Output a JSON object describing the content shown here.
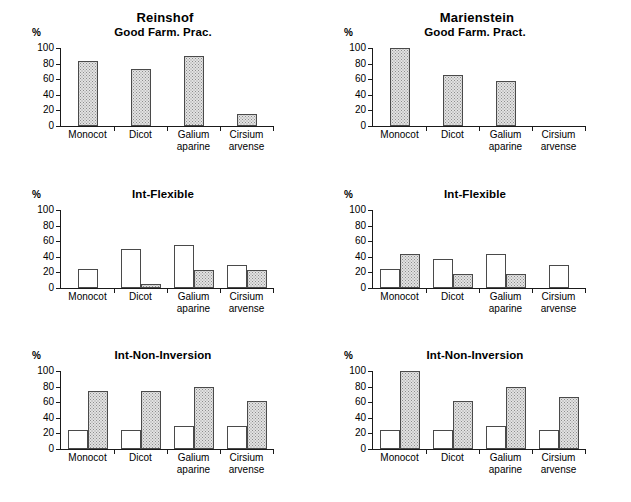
{
  "figure": {
    "sites": [
      {
        "name": "Reinshof"
      },
      {
        "name": "Marienstein"
      }
    ],
    "axis": {
      "unit_label": "%",
      "y_ticks": [
        "0",
        "20",
        "40",
        "60",
        "80",
        "100"
      ],
      "y_min": 0,
      "y_max": 100
    },
    "categories": [
      "Monocot",
      "Dicot",
      "Galium\naparine",
      "Cirsium\narvense"
    ]
  },
  "chart_data": [
    {
      "type": "bar",
      "title": "Good Farm. Prac.",
      "site": "Reinshof",
      "panel_id": "reinshof-good-farm-prac",
      "xlabel": "",
      "ylabel": "%",
      "ylim": [
        0,
        100
      ],
      "yticks": [
        0,
        20,
        40,
        60,
        80,
        100
      ],
      "grid": false,
      "legend": "none",
      "categories": [
        "Monocot",
        "Dicot",
        "Galium aparine",
        "Cirsium arvense"
      ],
      "series": [
        {
          "name": "open",
          "style": "white-outline",
          "values": [
            null,
            null,
            null,
            null
          ]
        },
        {
          "name": "stippled",
          "style": "grey-stipple",
          "values": [
            83,
            73,
            90,
            16
          ]
        }
      ]
    },
    {
      "type": "bar",
      "title": "Good Farm. Pract.",
      "site": "Marienstein",
      "panel_id": "marienstein-good-farm-pract",
      "xlabel": "",
      "ylabel": "%",
      "ylim": [
        0,
        100
      ],
      "yticks": [
        0,
        20,
        40,
        60,
        80,
        100
      ],
      "grid": false,
      "legend": "none",
      "categories": [
        "Monocot",
        "Dicot",
        "Galium aparine",
        "Cirsium arvense"
      ],
      "series": [
        {
          "name": "open",
          "style": "white-outline",
          "values": [
            null,
            null,
            null,
            null
          ]
        },
        {
          "name": "stippled",
          "style": "grey-stipple",
          "values": [
            100,
            66,
            58,
            0
          ]
        }
      ]
    },
    {
      "type": "bar",
      "title": "Int-Flexible",
      "site": "Reinshof",
      "panel_id": "reinshof-int-flexible",
      "xlabel": "",
      "ylabel": "%",
      "ylim": [
        0,
        100
      ],
      "yticks": [
        0,
        20,
        40,
        60,
        80,
        100
      ],
      "grid": false,
      "legend": "none",
      "categories": [
        "Monocot",
        "Dicot",
        "Galium aparine",
        "Cirsium arvense"
      ],
      "series": [
        {
          "name": "open",
          "style": "white-outline",
          "values": [
            25,
            50,
            55,
            30
          ]
        },
        {
          "name": "stippled",
          "style": "grey-stipple",
          "values": [
            0,
            5,
            23,
            23
          ]
        }
      ]
    },
    {
      "type": "bar",
      "title": "Int-Flexible",
      "site": "Marienstein",
      "panel_id": "marienstein-int-flexible",
      "xlabel": "",
      "ylabel": "%",
      "ylim": [
        0,
        100
      ],
      "yticks": [
        0,
        20,
        40,
        60,
        80,
        100
      ],
      "grid": false,
      "legend": "none",
      "categories": [
        "Monocot",
        "Dicot",
        "Galium aparine",
        "Cirsium arvense"
      ],
      "series": [
        {
          "name": "open",
          "style": "white-outline",
          "values": [
            25,
            37,
            43,
            30
          ]
        },
        {
          "name": "stippled",
          "style": "grey-stipple",
          "values": [
            43,
            18,
            18,
            0
          ]
        }
      ]
    },
    {
      "type": "bar",
      "title": "Int-Non-Inversion",
      "site": "Reinshof",
      "panel_id": "reinshof-int-non-inversion",
      "xlabel": "",
      "ylabel": "%",
      "ylim": [
        0,
        100
      ],
      "yticks": [
        0,
        20,
        40,
        60,
        80,
        100
      ],
      "grid": false,
      "legend": "none",
      "categories": [
        "Monocot",
        "Dicot",
        "Galium aparine",
        "Cirsium arvense"
      ],
      "series": [
        {
          "name": "open",
          "style": "white-outline",
          "values": [
            25,
            24,
            29,
            29
          ]
        },
        {
          "name": "stippled",
          "style": "grey-stipple",
          "values": [
            75,
            74,
            80,
            61
          ]
        }
      ]
    },
    {
      "type": "bar",
      "title": "Int-Non-Inversion",
      "site": "Marienstein",
      "panel_id": "marienstein-int-non-inversion",
      "xlabel": "",
      "ylabel": "%",
      "ylim": [
        0,
        100
      ],
      "yticks": [
        0,
        20,
        40,
        60,
        80,
        100
      ],
      "grid": false,
      "legend": "none",
      "categories": [
        "Monocot",
        "Dicot",
        "Galium aparine",
        "Cirsium arvense"
      ],
      "series": [
        {
          "name": "open",
          "style": "white-outline",
          "values": [
            25,
            24,
            30,
            24
          ]
        },
        {
          "name": "stippled",
          "style": "grey-stipple",
          "values": [
            100,
            62,
            80,
            67
          ]
        }
      ]
    }
  ],
  "colors": {
    "axis": "#1a1a1a",
    "bar_outline": "#4a4a4a",
    "bar_fill_stipple": "#e2e2e2",
    "bar_fill_open": "#ffffff",
    "background": "#ffffff"
  }
}
